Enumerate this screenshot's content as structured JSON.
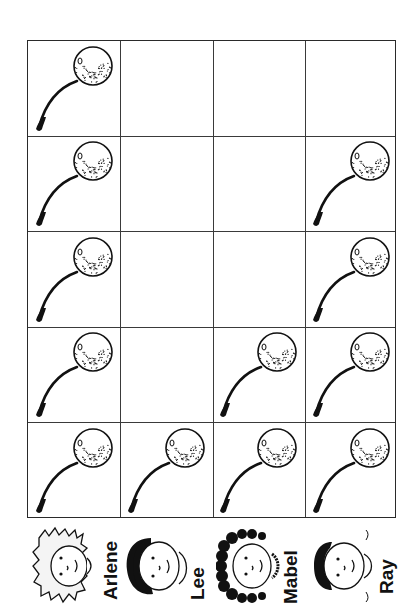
{
  "chart_data": {
    "type": "pictograph",
    "orientation": "rotated-90-ccw",
    "title": "",
    "icon": "cherry",
    "icon_value": 1,
    "categories": [
      "Arlene",
      "Lee",
      "Mabel",
      "Ray"
    ],
    "values": [
      5,
      1,
      2,
      4
    ],
    "max_per_column": 5,
    "grid": {
      "columns": 4,
      "rows": 5
    }
  },
  "labels": {
    "arlene": "Arlene",
    "lee": "Lee",
    "mabel": "Mabel",
    "ray": "Ray"
  },
  "colors": {
    "ink": "#111111",
    "grid_line": "#3a3a3a",
    "background": "#ffffff"
  }
}
